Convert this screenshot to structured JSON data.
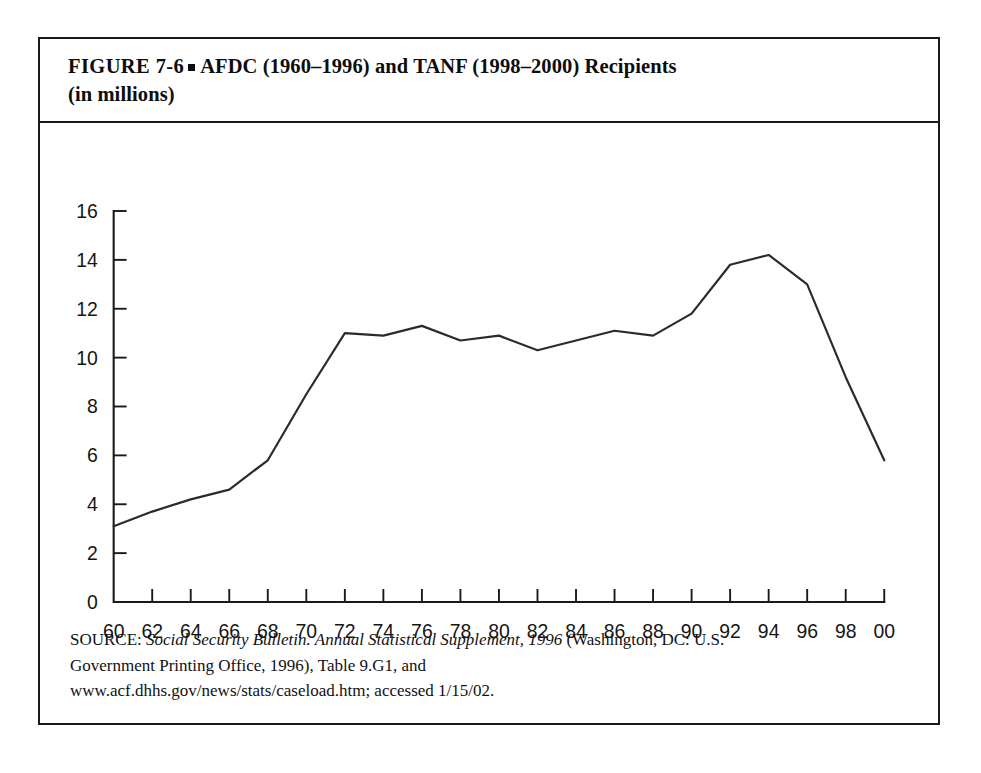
{
  "figure": {
    "label": "FIGURE  7-6",
    "bullet": "square-bullet-icon",
    "title_main": "AFDC (1960–1996) and TANF (1998–2000) Recipients",
    "title_second_line": "(in millions)"
  },
  "source": {
    "prefix": "SOURCE:",
    "italic_part": "Social Security Bulletin. Annual Statistical Supplement, 1996",
    "line1_tail": "(Washington, DC: U.S.",
    "line2": "Government Printing Office, 1996), Table 9.G1, and",
    "line3": "www.acf.dhhs.gov/news/stats/caseload.htm; accessed 1/15/02."
  },
  "chart_data": {
    "type": "line",
    "title": "AFDC (1960–1996) and TANF (1998–2000) Recipients (in millions)",
    "xlabel": "",
    "ylabel": "",
    "grid": false,
    "legend": "none",
    "line_color": "#2b2b2b",
    "x": [
      "60",
      "62",
      "64",
      "66",
      "68",
      "70",
      "72",
      "74",
      "76",
      "78",
      "80",
      "82",
      "84",
      "86",
      "88",
      "90",
      "92",
      "94",
      "96",
      "98",
      "00"
    ],
    "x_numeric": [
      1960,
      1962,
      1964,
      1966,
      1968,
      1970,
      1972,
      1974,
      1976,
      1978,
      1980,
      1982,
      1984,
      1986,
      1988,
      1990,
      1992,
      1994,
      1996,
      1998,
      2000
    ],
    "values": [
      3.1,
      3.7,
      4.2,
      4.6,
      5.8,
      8.5,
      11.0,
      10.9,
      11.3,
      10.7,
      10.9,
      10.3,
      10.7,
      11.1,
      10.9,
      11.8,
      13.8,
      14.2,
      13.0,
      9.2,
      5.8
    ],
    "ylim": [
      0,
      16
    ],
    "yticks": [
      0,
      2,
      4,
      6,
      8,
      10,
      12,
      14,
      16
    ],
    "ytick_labels": [
      "0",
      "2",
      "4",
      "6",
      "8",
      "10",
      "12",
      "14",
      "16"
    ],
    "xtick_labels": [
      "60",
      "62",
      "64",
      "66",
      "68",
      "70",
      "72",
      "74",
      "76",
      "78",
      "80",
      "82",
      "84",
      "86",
      "88",
      "90",
      "92",
      "94",
      "96",
      "98",
      "00"
    ],
    "units": "millions of recipients"
  }
}
